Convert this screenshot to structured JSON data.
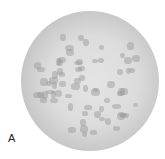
{
  "figure": {
    "panel_label": "A",
    "colors": {
      "background": "#ffffff",
      "rim": "#5e5e5e",
      "interior": "#e0e0e0",
      "spots": "#969696"
    }
  }
}
